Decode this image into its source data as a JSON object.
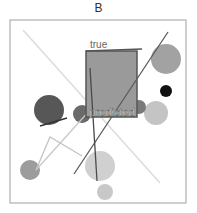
{
  "panel": {
    "title": "B",
    "labels": {
      "true_label": "true",
      "predicted_label": "predicted"
    }
  },
  "colors": {
    "frame": "#b0b0b0",
    "box_fill": "#9a9a9a",
    "box_stroke": "#555555",
    "dark_line": "#5a5a5a",
    "faint_line": "#dcdcdc",
    "light_line": "#c4c4c4"
  },
  "shapes": {
    "circles": [
      {
        "cx": 166,
        "cy": 59,
        "r": 15,
        "fill": "#a2a2a2"
      },
      {
        "cx": 166,
        "cy": 91,
        "r": 6,
        "fill": "#111111"
      },
      {
        "cx": 156,
        "cy": 113,
        "r": 12,
        "fill": "#c4c4c4"
      },
      {
        "cx": 49,
        "cy": 110,
        "r": 15,
        "fill": "#575757"
      },
      {
        "cx": 82,
        "cy": 114,
        "r": 9,
        "fill": "#6a6a6a"
      },
      {
        "cx": 139,
        "cy": 107,
        "r": 7,
        "fill": "#7a7a7a"
      },
      {
        "cx": 100,
        "cy": 166,
        "r": 15,
        "fill": "#d0d0d0"
      },
      {
        "cx": 105,
        "cy": 192,
        "r": 8,
        "fill": "#c8c8c8"
      },
      {
        "cx": 30,
        "cy": 170,
        "r": 10,
        "fill": "#9c9c9c"
      }
    ]
  }
}
